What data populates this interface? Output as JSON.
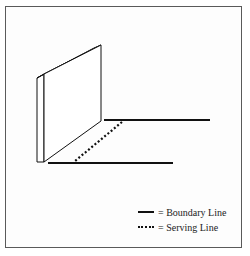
{
  "diagram": {
    "type": "perspective-illustration",
    "colors": {
      "stroke": "#111111",
      "frame": "#5a5a5a",
      "background": "#ffffff"
    },
    "wall": {
      "front_face": [
        [
          44,
          74
        ],
        [
          101,
          45
        ],
        [
          101,
          121
        ],
        [
          44,
          162
        ]
      ],
      "side_face": [
        [
          37,
          78
        ],
        [
          44,
          74
        ],
        [
          44,
          162
        ],
        [
          37,
          162
        ]
      ]
    },
    "lines": [
      {
        "name": "boundary-line-far",
        "style": "solid",
        "from": [
          104,
          120
        ],
        "to": [
          210,
          120
        ]
      },
      {
        "name": "boundary-line-near",
        "style": "solid",
        "from": [
          48,
          163
        ],
        "to": [
          173,
          163
        ]
      },
      {
        "name": "serving-line",
        "style": "dotted",
        "from": [
          122,
          122
        ],
        "to": [
          75,
          161
        ]
      }
    ]
  },
  "legend": {
    "items": [
      {
        "style": "solid",
        "label": "= Boundary Line"
      },
      {
        "style": "dotted",
        "label": "= Serving Line"
      }
    ]
  }
}
